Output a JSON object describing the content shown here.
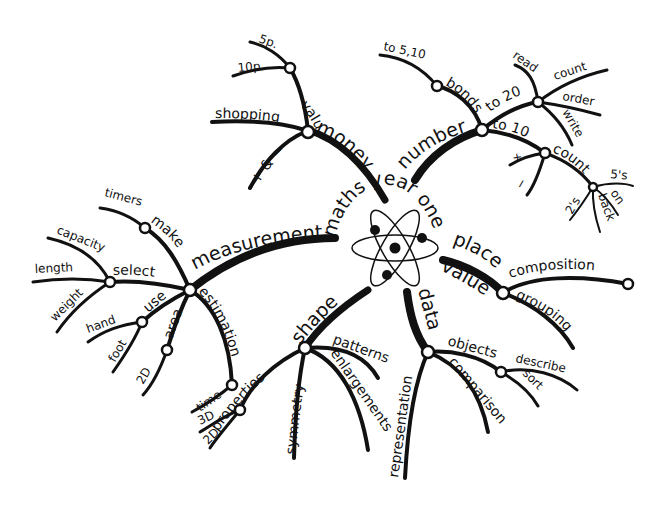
{
  "title": "maths year one",
  "colors": {
    "ink": "#111111",
    "background": "#ffffff"
  },
  "center_icon": "atom-icon",
  "branches": {
    "money": {
      "label": "money",
      "children": {
        "values": {
          "label": "values",
          "children": [
            "5p.",
            "10p."
          ]
        },
        "shopping": {
          "label": "shopping"
        },
        "plus_minus": {
          "label": "+ & −"
        }
      }
    },
    "number": {
      "label": "number",
      "children": {
        "bonds": {
          "label": "bonds",
          "children": [
            "to 5,10"
          ]
        },
        "to20": {
          "label": "to 20",
          "children": [
            "read",
            "count",
            "order",
            "write"
          ]
        },
        "to10": {
          "label": "to 10",
          "children": [
            "+",
            "−"
          ]
        },
        "count": {
          "label": "count",
          "children": [
            "2's",
            "5's",
            "on",
            "back"
          ]
        }
      }
    },
    "measurement": {
      "label": "measurement",
      "children": {
        "make": {
          "label": "make",
          "children": [
            "timers"
          ]
        },
        "select": {
          "label": "select",
          "children": [
            "capacity",
            "length",
            "weight"
          ]
        },
        "use": {
          "label": "use",
          "children": [
            "hand",
            "foot"
          ]
        },
        "area": {
          "label": "area",
          "children": [
            "2D"
          ]
        },
        "estimation": {
          "label": "estimation",
          "children": [
            "time"
          ]
        }
      }
    },
    "shape": {
      "label": "shape",
      "children": {
        "properties": {
          "label": "properties",
          "children": [
            "3D",
            "2D"
          ]
        },
        "symmetry": {
          "label": "symmetry"
        },
        "patterns": {
          "label": "patterns"
        },
        "enlargements": {
          "label": "enlargements"
        }
      }
    },
    "data": {
      "label": "data",
      "children": {
        "representation": {
          "label": "representation"
        },
        "comparison": {
          "label": "comparison"
        },
        "objects": {
          "label": "objects",
          "children": [
            "describe",
            "sort"
          ]
        }
      }
    },
    "place_value": {
      "label_line1": "place",
      "label_line2": "value",
      "children": {
        "composition": {
          "label": "composition"
        },
        "grouping": {
          "label": "grouping"
        }
      }
    }
  }
}
